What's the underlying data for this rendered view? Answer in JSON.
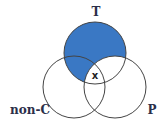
{
  "diagram": {
    "type": "venn",
    "sets": [
      {
        "id": "T",
        "label": "T"
      },
      {
        "id": "nonC",
        "label": "non-C"
      },
      {
        "id": "P",
        "label": "P"
      }
    ],
    "shaded_region": "T minus P",
    "marker": {
      "label": "x",
      "region": "T ∩ non-C ∩ P"
    },
    "colors": {
      "fill": "#3a78c4",
      "stroke": "#444444",
      "label": "#2b2f4a"
    }
  }
}
